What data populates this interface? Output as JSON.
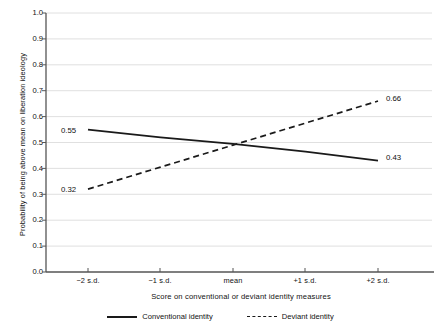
{
  "chart_data": {
    "type": "line",
    "title": "",
    "xlabel": "Score on conventional or deviant identity measures",
    "ylabel": "Probability of being above mean on liberation ideology",
    "categories": [
      "−2 s.d.",
      "−1 s.d.",
      "mean",
      "+1 s.d.",
      "+2 s.d."
    ],
    "ylim": [
      0.0,
      1.0
    ],
    "ytick_labels": [
      "1.0",
      "0.9",
      "0.8",
      "0.7",
      "0.6",
      "0.5",
      "0.4",
      "0.3",
      "0.2",
      "0.1",
      "0.0"
    ],
    "ytick_values": [
      1.0,
      0.9,
      0.8,
      0.7,
      0.6,
      0.5,
      0.4,
      0.3,
      0.2,
      0.1,
      0.0
    ],
    "grid": "horizontal",
    "legend_position": "bottom",
    "series": [
      {
        "name": "Conventional identity",
        "style": "solid",
        "color": "#1a1a1a",
        "values": [
          0.55,
          0.52,
          0.495,
          0.465,
          0.43
        ],
        "endpoint_labels": {
          "start": "0.55",
          "end": "0.43"
        }
      },
      {
        "name": "Deviant identity",
        "style": "dashed",
        "color": "#1a1a1a",
        "values": [
          0.32,
          0.405,
          0.49,
          0.575,
          0.66
        ],
        "endpoint_labels": {
          "start": "0.32",
          "end": "0.66"
        }
      }
    ],
    "annotations": [
      {
        "text": "0.55",
        "series": "Conventional identity",
        "at": "−2 s.d."
      },
      {
        "text": "0.32",
        "series": "Deviant identity",
        "at": "−2 s.d."
      },
      {
        "text": "0.66",
        "series": "Deviant identity",
        "at": "+2 s.d."
      },
      {
        "text": "0.43",
        "series": "Conventional identity",
        "at": "+2 s.d."
      }
    ]
  },
  "axes": {
    "ylabel": "Probability of being above mean on liberation ideology",
    "xlabel": "Score on conventional or deviant identity measures",
    "yticks": [
      "1.0",
      "0.9",
      "0.8",
      "0.7",
      "0.6",
      "0.5",
      "0.4",
      "0.3",
      "0.2",
      "0.1",
      "0.0"
    ],
    "xticks": [
      "−2 s.d.",
      "−1 s.d.",
      "mean",
      "+1 s.d.",
      "+2 s.d."
    ]
  },
  "legend": {
    "items": [
      {
        "label": "Conventional identity",
        "style": "solid"
      },
      {
        "label": "Deviant identity",
        "style": "dashed"
      }
    ]
  },
  "labels": {
    "conv_start": "0.55",
    "conv_end": "0.43",
    "dev_start": "0.32",
    "dev_end": "0.66"
  },
  "colors": {
    "line": "#1a1a1a",
    "grid": "#d8d8d8",
    "axis": "#4a4a4a",
    "background": "#ffffff"
  }
}
